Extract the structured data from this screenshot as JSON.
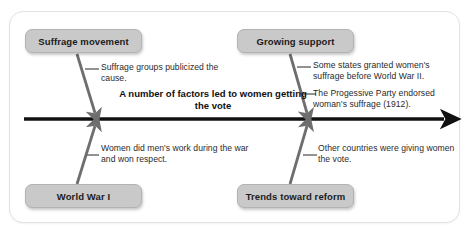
{
  "diagram": {
    "type": "fishbone",
    "spine": {
      "title": "A number of factors led to women getting the vote",
      "arrow_direction": "right"
    },
    "categories": [
      {
        "id": "suffrage-movement",
        "label": "Suffrage movement",
        "position": "top-left"
      },
      {
        "id": "growing-support",
        "label": "Growing support",
        "position": "top-right"
      },
      {
        "id": "world-war-i",
        "label": "World War I",
        "position": "bottom-left"
      },
      {
        "id": "trends-toward-reform",
        "label": "Trends toward reform",
        "position": "bottom-right"
      }
    ],
    "notes": [
      {
        "id": "note-suffrage-groups",
        "category": "suffrage-movement",
        "text": "Suffrage groups publicized the cause."
      },
      {
        "id": "note-women-work",
        "category": "world-war-i",
        "text": "Women did men's work during the war and won respect."
      },
      {
        "id": "note-states-granted",
        "category": "growing-support",
        "text": "Some states granted women's suffrage before World War II."
      },
      {
        "id": "note-progressive-party",
        "category": "growing-support",
        "text": "The Progessive Party endorsed woman's suffrage (1912)."
      },
      {
        "id": "note-other-countries",
        "category": "trends-toward-reform",
        "text": "Other countries were giving women the vote."
      }
    ]
  },
  "colors": {
    "panel_background": "#ffffff",
    "panel_border": "#e2e2e2",
    "box_fill": "#c9c9c9",
    "box_border": "#b3b3b3",
    "spine": "#111111",
    "branch": "#6e6e6e",
    "text": "#2a2a2a"
  }
}
